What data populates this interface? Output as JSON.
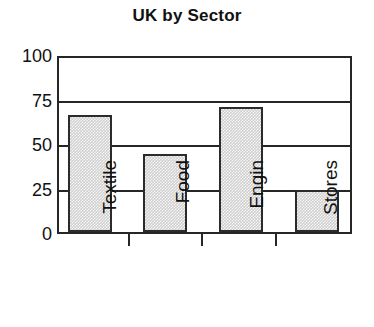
{
  "chart_data": {
    "type": "bar",
    "title": "UK by Sector",
    "xlabel": "",
    "ylabel": "",
    "categories": [
      "Textile",
      "Food",
      "Engin",
      "Stores"
    ],
    "values": [
      67,
      45,
      72,
      24
    ],
    "ylim": [
      0,
      100
    ],
    "yticks": [
      0,
      25,
      50,
      75,
      100
    ],
    "ytick_labels": [
      "0",
      "25",
      "50",
      "75",
      "100"
    ],
    "grid": true,
    "grid_axis": "y",
    "legend": false,
    "legend_position": "none",
    "bar_fill_color": "#cfcfcf",
    "bar_edge_color": "#2b2b2b",
    "axis_color": "#262626",
    "background_color": "#ffffff",
    "text_color": "#111111",
    "xtick_label_rotation": -90
  }
}
